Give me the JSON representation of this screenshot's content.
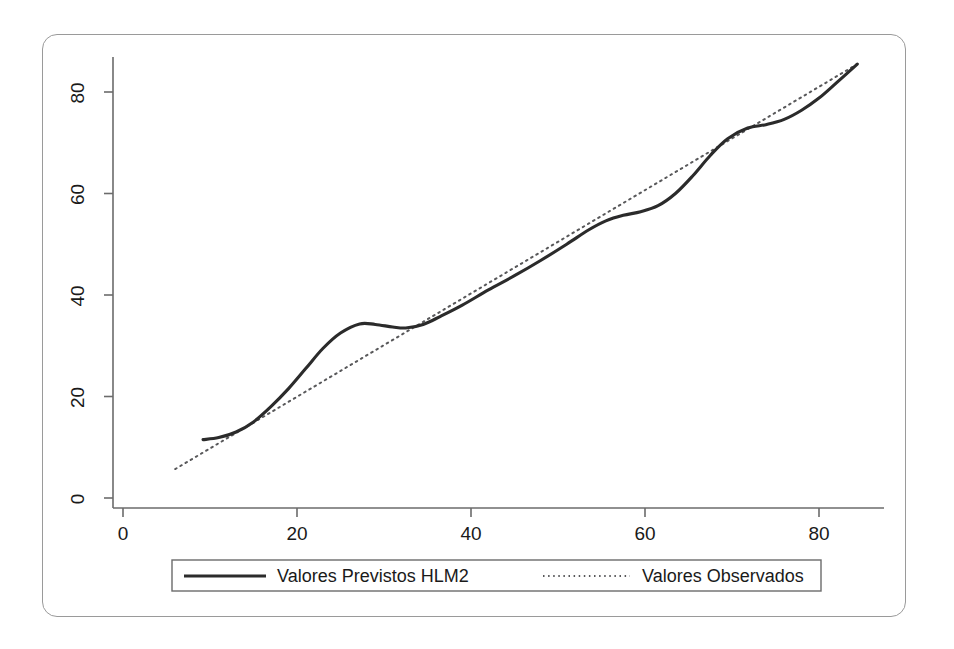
{
  "figure": {
    "background_color": "#ffffff",
    "panel_border_color": "#9a9a9a",
    "ink_color": "#2b2b2b",
    "axis_color": "#6b6b6b",
    "observed_color": "#58585a"
  },
  "axes": {
    "x_tick_labels": [
      "0",
      "20",
      "40",
      "60",
      "80"
    ],
    "y_tick_labels": [
      "0",
      "20",
      "40",
      "60",
      "80"
    ],
    "x_label": "",
    "y_label": "",
    "x_tick_values": [
      0,
      20,
      40,
      60,
      80
    ],
    "y_tick_values": [
      0,
      20,
      40,
      60,
      80
    ]
  },
  "legend": {
    "position": "bottom-center",
    "entries": [
      {
        "label": "Valores Previstos HLM2",
        "style": "solid",
        "color": "#2b2b2b"
      },
      {
        "label": "Valores Observados",
        "style": "dotted",
        "color": "#58585a"
      }
    ]
  },
  "chart_data": {
    "type": "line",
    "title": "",
    "subtitle": "",
    "xlabel": "",
    "ylabel": "",
    "xlim": [
      -2,
      87
    ],
    "ylim": [
      -3,
      88
    ],
    "grid": false,
    "legend_position": "bottom-center",
    "annotations": [],
    "series": [
      {
        "name": "Valores Previstos HLM2",
        "style": "solid",
        "color": "#2b2b2b",
        "x": [
          9.2,
          11.0,
          13.0,
          15.0,
          17.0,
          19.0,
          21.0,
          23.0,
          25.0,
          27.2,
          29.0,
          31.0,
          32.5,
          34.5,
          36.5,
          39.0,
          42.0,
          45.0,
          48.0,
          51.0,
          53.5,
          55.5,
          57.5,
          59.5,
          61.5,
          63.5,
          65.5,
          67.5,
          69.5,
          71.8,
          74.0,
          76.0,
          78.0,
          80.0,
          82.0,
          84.4
        ],
        "y": [
          11.5,
          11.9,
          13.0,
          15.0,
          18.0,
          21.5,
          25.5,
          29.5,
          32.5,
          34.3,
          34.2,
          33.7,
          33.5,
          34.2,
          35.8,
          38.0,
          41.0,
          43.8,
          46.8,
          50.0,
          52.8,
          54.6,
          55.7,
          56.4,
          57.6,
          60.0,
          63.5,
          67.5,
          70.8,
          72.9,
          73.6,
          74.6,
          76.4,
          78.8,
          81.8,
          85.5
        ]
      },
      {
        "name": "Valores Observados",
        "style": "dotted",
        "color": "#58585a",
        "x": [
          6.0,
          84.4
        ],
        "y": [
          5.7,
          85.5
        ],
        "description": "reference identity line y = x"
      }
    ]
  }
}
